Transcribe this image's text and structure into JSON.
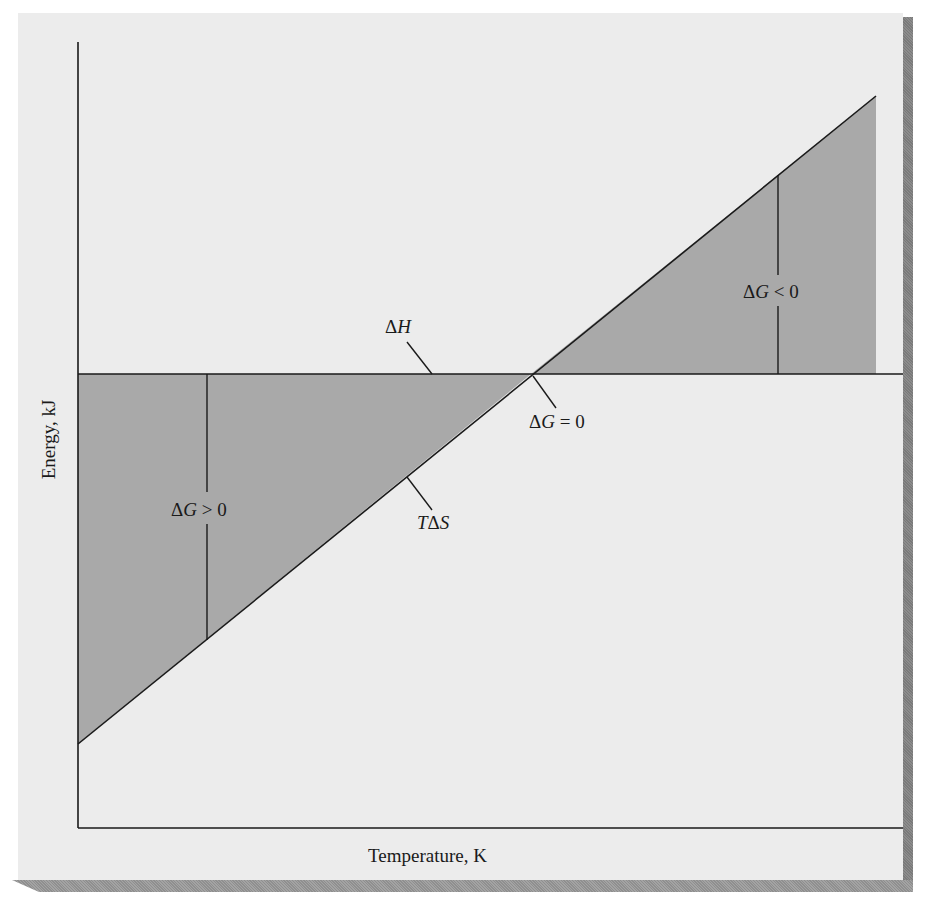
{
  "figure": {
    "type": "diagram"
  },
  "axes": {
    "x_label": "Temperature, K",
    "y_label": "Energy, kJ"
  },
  "lines": {
    "enthalpy": {
      "symbol": "Δ",
      "var": "H",
      "label": "ΔH"
    },
    "entropy_term": {
      "prefix": "T",
      "symbol": "Δ",
      "var": "S",
      "label": "TΔS"
    }
  },
  "annotations": {
    "positive": {
      "delta": "Δ",
      "var": "G",
      "rel": " > 0",
      "label": "ΔG > 0"
    },
    "zero": {
      "delta": "Δ",
      "var": "G",
      "rel": " = 0",
      "label": "ΔG = 0"
    },
    "negative": {
      "delta": "Δ",
      "var": "G",
      "rel": " < 0",
      "label": "ΔG < 0"
    }
  },
  "colors": {
    "page": "#ececec",
    "shade": "#a9a9a9",
    "line": "#1a1a1a",
    "shadow": "#808080"
  }
}
